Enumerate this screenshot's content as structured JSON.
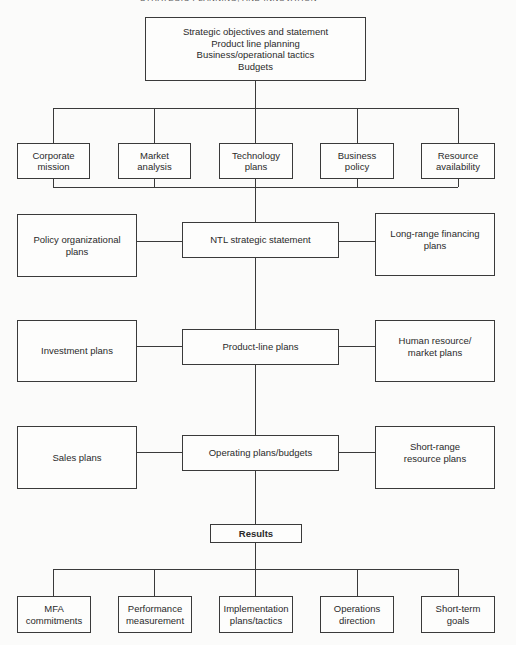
{
  "page_header": "STRATEGIC PLANNING, AND INNOVATION",
  "top_box": {
    "lines": [
      "Strategic objectives and statement",
      "Product line planning",
      "Business/operational tactics",
      "Budgets"
    ]
  },
  "inputs_row": [
    {
      "line1": "Corporate",
      "line2": "mission"
    },
    {
      "line1": "Market",
      "line2": "analysis"
    },
    {
      "line1": "Technology",
      "line2": "plans"
    },
    {
      "line1": "Business",
      "line2": "policy"
    },
    {
      "line1": "Resource",
      "line2": "availability"
    }
  ],
  "levels": [
    {
      "left": {
        "line1": "Policy organizational",
        "line2": "plans"
      },
      "center": {
        "label": "NTL strategic statement"
      },
      "right": {
        "line1": "Long-range financing",
        "line2": "plans"
      }
    },
    {
      "left": {
        "line1": "Investment plans",
        "line2": ""
      },
      "center": {
        "label": "Product-line plans"
      },
      "right": {
        "line1": "Human resource/",
        "line2": "market plans"
      }
    },
    {
      "left": {
        "line1": "Sales plans",
        "line2": ""
      },
      "center": {
        "label": "Operating plans/budgets"
      },
      "right": {
        "line1": "Short-range",
        "line2": "resource plans"
      }
    }
  ],
  "results_box": {
    "label": "Results"
  },
  "outputs_row": [
    {
      "line1": "MFA",
      "line2": "commitments"
    },
    {
      "line1": "Performance",
      "line2": "measurement"
    },
    {
      "line1": "Implementation",
      "line2": "plans/tactics"
    },
    {
      "line1": "Operations",
      "line2": "direction"
    },
    {
      "line1": "Short-term",
      "line2": "goals"
    }
  ]
}
